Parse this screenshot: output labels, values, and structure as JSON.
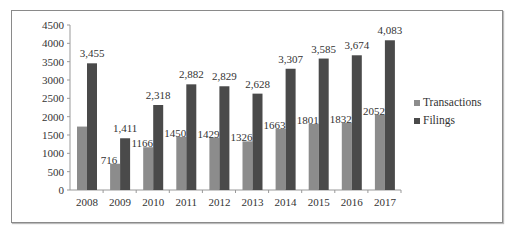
{
  "chart_data": {
    "type": "bar",
    "title": "",
    "xlabel": "",
    "ylabel": "",
    "ylim": [
      0,
      4500
    ],
    "yticks": [
      0,
      500,
      1000,
      1500,
      2000,
      2500,
      3000,
      3500,
      4000,
      4500
    ],
    "grid": false,
    "legend_position": "right",
    "categories": [
      "2008",
      "2009",
      "2010",
      "2011",
      "2012",
      "2013",
      "2014",
      "2015",
      "2016",
      "2017"
    ],
    "series": [
      {
        "name": "Transactions",
        "color": "#8c8c8c",
        "values": [
          1730,
          716,
          1166,
          1450,
          1429,
          1326,
          1663,
          1801,
          1832,
          2052
        ],
        "labels": [
          "",
          "716",
          "1166",
          "1450",
          "1429",
          "1326",
          "1663",
          "1801",
          "1832",
          "2052"
        ]
      },
      {
        "name": "Filings",
        "color": "#4a4a4a",
        "values": [
          3455,
          1411,
          2318,
          2882,
          2829,
          2628,
          3307,
          3585,
          3674,
          4083
        ],
        "labels": [
          "3,455",
          "1,411",
          "2,318",
          "2,882",
          "2,829",
          "2,628",
          "3,307",
          "3,585",
          "3,674",
          "4,083"
        ]
      }
    ]
  }
}
